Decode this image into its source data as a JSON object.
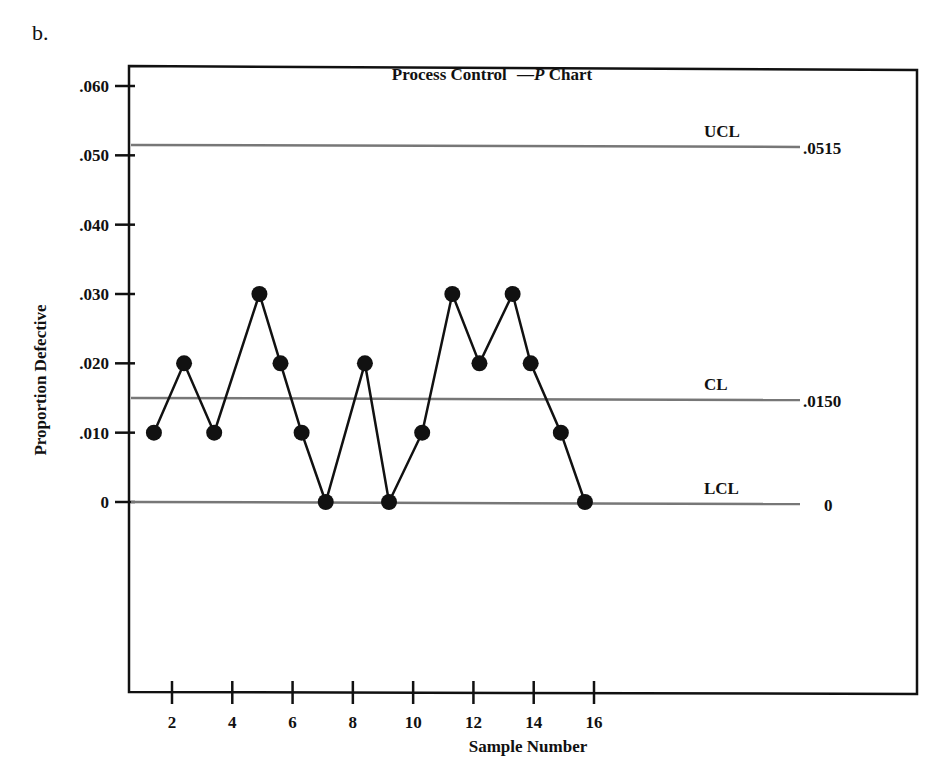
{
  "figure": {
    "part_label": "b.",
    "title_prefix": "Process Control",
    "title_dash": "—",
    "title_italic": "P",
    "title_suffix": "Chart"
  },
  "chart_data": {
    "type": "line",
    "title": "Process Control —P Chart",
    "xlabel": "Sample Number",
    "ylabel": "Proportion Defective",
    "x": [
      1,
      2,
      3,
      4,
      5,
      6,
      7,
      8,
      9,
      10,
      11,
      12,
      13,
      14,
      15,
      16
    ],
    "series": [
      {
        "name": "Proportion Defective",
        "values": [
          0.01,
          0.02,
          0.01,
          0.03,
          0.02,
          0.01,
          0.0,
          0.02,
          0.0,
          0.01,
          0.03,
          0.02,
          0.03,
          0.02,
          0.01,
          0.0
        ],
        "marker": "filled-circle",
        "color": "#111111"
      }
    ],
    "x_positions_note": "points plotted at approximately 1.4, 2.4, 3.4, 4.9, 5.6, 6.3, 7.1, 8.4, 9.2, 10.3, 11.3, 12.2, 13.3, 13.9, 14.9, 15.7",
    "x_plot": [
      1.4,
      2.4,
      3.4,
      4.9,
      5.6,
      6.3,
      7.1,
      8.4,
      9.2,
      10.3,
      11.3,
      12.2,
      13.3,
      13.9,
      14.9,
      15.7
    ],
    "xticks": [
      2,
      4,
      6,
      8,
      10,
      12,
      14,
      16
    ],
    "xtick_labels": [
      "2",
      "4",
      "6",
      "8",
      "10",
      "12",
      "14",
      "16"
    ],
    "yticks": [
      0,
      0.01,
      0.02,
      0.03,
      0.04,
      0.05,
      0.06
    ],
    "ytick_labels": [
      "0",
      ".010",
      ".020",
      ".030",
      ".040",
      ".050",
      ".060"
    ],
    "ylim": [
      0,
      0.06
    ],
    "control_lines": [
      {
        "name": "UCL",
        "value": 0.0515,
        "value_label": ".0515",
        "color": "#777777"
      },
      {
        "name": "CL",
        "value": 0.015,
        "value_label": ".0150",
        "color": "#777777"
      },
      {
        "name": "LCL",
        "value": 0,
        "value_label": "0",
        "color": "#777777"
      }
    ],
    "grid": false,
    "legend": "none"
  }
}
